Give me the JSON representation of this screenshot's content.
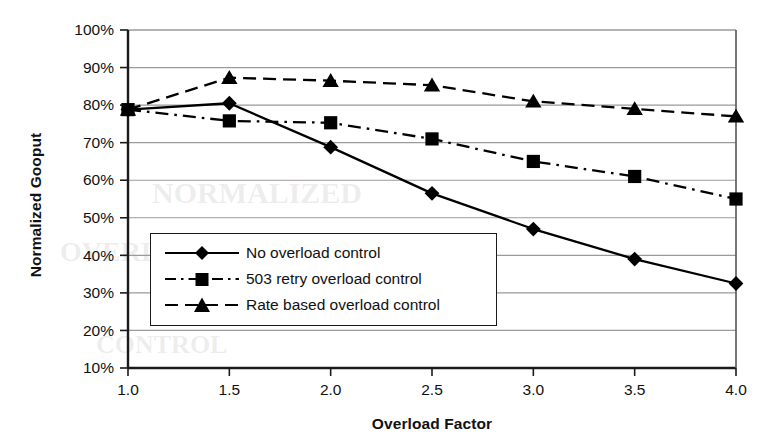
{
  "chart_data": {
    "type": "line",
    "title": "",
    "xlabel": "Overload Factor",
    "ylabel": "Normalized Gooput",
    "x": [
      1.0,
      1.5,
      2.0,
      2.5,
      3.0,
      3.5,
      4.0
    ],
    "xtick_labels": [
      "1.0",
      "1.5",
      "2.0",
      "2.5",
      "3.0",
      "3.5",
      "4.0"
    ],
    "ytick_labels": [
      "100%",
      "90%",
      "80%",
      "70%",
      "60%",
      "50%",
      "40%",
      "30%",
      "20%",
      "10%"
    ],
    "ytick_values": [
      100,
      90,
      80,
      70,
      60,
      50,
      40,
      30,
      20,
      10
    ],
    "xlim": [
      1.0,
      4.0
    ],
    "ylim": [
      10,
      100
    ],
    "grid": "horizontal",
    "legend_position": "inside-lower-left",
    "series": [
      {
        "name": "No overload control",
        "marker": "diamond",
        "line_style": "solid",
        "color": "#000000",
        "values": [
          78.8,
          80.5,
          68.8,
          56.5,
          47.0,
          39.0,
          32.5
        ]
      },
      {
        "name": "503 retry overload control",
        "marker": "square",
        "line_style": "dash-dot",
        "color": "#000000",
        "values": [
          78.8,
          75.8,
          75.3,
          71.0,
          65.0,
          61.0,
          55.0
        ]
      },
      {
        "name": "Rate based overload control",
        "marker": "triangle",
        "line_style": "dashed",
        "color": "#000000",
        "values": [
          78.8,
          87.3,
          86.5,
          85.3,
          81.0,
          79.0,
          77.0
        ]
      }
    ]
  },
  "legend": {
    "items": [
      {
        "label": "No overload control"
      },
      {
        "label": "503 retry overload control"
      },
      {
        "label": "Rate based overload control"
      }
    ]
  },
  "colors": {
    "ink": "#111111",
    "gridline": "#9a9a9a",
    "axis": "#1a1a1a",
    "background": "#ffffff"
  },
  "artifacts": {
    "bleed_text_1": "NORMALIZED",
    "bleed_text_2": "OVERLOAD",
    "bleed_text_3": "CONTROL"
  }
}
